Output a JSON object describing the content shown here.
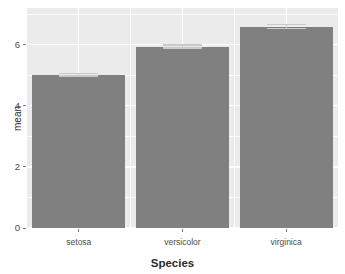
{
  "chart_data": {
    "type": "bar",
    "title": "",
    "xlabel": "Species",
    "ylabel": "mean",
    "categories": [
      "setosa",
      "versicolor",
      "virginica"
    ],
    "values": [
      5.01,
      5.94,
      6.59
    ],
    "errors": [
      0.07,
      0.07,
      0.09
    ],
    "ylim": [
      0,
      7.2
    ],
    "yticks": [
      0,
      2,
      4,
      6
    ],
    "ytick_labels": [
      "0",
      "2",
      "4",
      "6"
    ],
    "yminor": [
      1,
      3,
      5,
      7
    ],
    "grid": true,
    "legend": "none",
    "series": [
      {
        "name": "mean",
        "values": [
          5.01,
          5.94,
          6.59
        ]
      }
    ],
    "colors": {
      "bar_fill": "#808080",
      "errorbar": "#c9c9c9",
      "panel_background": "#ebebeb",
      "gridline": "#ffffff",
      "axis_text": "#4d4d4d",
      "axis_title": "#2b2b2b",
      "figure_background": "#ffffff"
    }
  },
  "axes": {
    "y": {
      "title": "mean",
      "ticks": [
        {
          "value": 6,
          "label": "6"
        },
        {
          "value": 4,
          "label": "4"
        },
        {
          "value": 2,
          "label": "2"
        },
        {
          "value": 0,
          "label": "0"
        }
      ]
    },
    "x": {
      "title": "Species",
      "ticks": [
        {
          "label": "setosa"
        },
        {
          "label": "versicolor"
        },
        {
          "label": "virginica"
        }
      ]
    }
  },
  "artifacts": {
    "clipped_title": "",
    "bleed_text": ""
  }
}
